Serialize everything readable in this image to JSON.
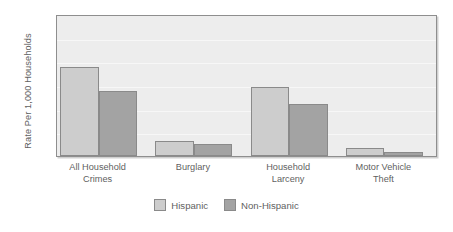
{
  "chart_data": {
    "type": "bar",
    "title": "",
    "xlabel": "",
    "ylabel": "Rate Per 1,000 Households",
    "ylim": [
      0,
      300
    ],
    "yticks": [
      "0",
      "50",
      "100",
      "150",
      "200",
      "250",
      "300"
    ],
    "grid": true,
    "legend_position": "bottom-center",
    "categories": [
      "All Household\nCrimes",
      "Burglary",
      "Household\nLarceny",
      "Motor Vehicle\nTheft"
    ],
    "category_lines": [
      [
        "All Household",
        "Crimes"
      ],
      [
        "Burglary",
        ""
      ],
      [
        "Household",
        "Larceny"
      ],
      [
        "Motor Vehicle",
        "Theft"
      ]
    ],
    "series": [
      {
        "name": "Hispanic",
        "color": "#cdcdcd",
        "values": [
          189,
          32,
          145,
          17
        ]
      },
      {
        "name": "Non-Hispanic",
        "color": "#a3a3a3",
        "values": [
          138,
          25,
          110,
          8
        ]
      }
    ]
  },
  "legend": {
    "items": [
      {
        "label": "Hispanic",
        "swatch": "light"
      },
      {
        "label": "Non-Hispanic",
        "swatch": "dark"
      }
    ]
  },
  "colors": {
    "plot_background": "#ededed",
    "plot_border": "#8e8e8e",
    "gridline": "#f7f7f7",
    "bar_border": "#8a8a8a",
    "text": "#5f5f5f",
    "page_background": "#ffffff"
  }
}
